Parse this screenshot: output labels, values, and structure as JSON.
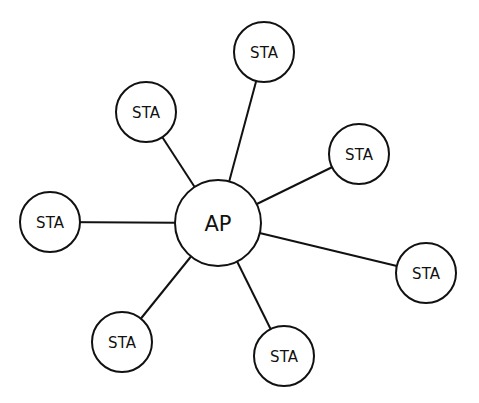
{
  "diagram": {
    "type": "star-topology",
    "colors": {
      "stroke": "#111111",
      "fill": "#ffffff",
      "background": "#ffffff"
    },
    "hub": {
      "id": "ap",
      "label": "AP",
      "x": 218,
      "y": 223,
      "r": 43
    },
    "nodes": [
      {
        "id": "sta-top",
        "label": "STA",
        "x": 264,
        "y": 52,
        "r": 30
      },
      {
        "id": "sta-upper-left",
        "label": "STA",
        "x": 146,
        "y": 112,
        "r": 30
      },
      {
        "id": "sta-upper-right",
        "label": "STA",
        "x": 359,
        "y": 154,
        "r": 30
      },
      {
        "id": "sta-left",
        "label": "STA",
        "x": 50,
        "y": 222,
        "r": 30
      },
      {
        "id": "sta-right",
        "label": "STA",
        "x": 426,
        "y": 273,
        "r": 30
      },
      {
        "id": "sta-lower-left",
        "label": "STA",
        "x": 122,
        "y": 342,
        "r": 30
      },
      {
        "id": "sta-lower-right",
        "label": "STA",
        "x": 284,
        "y": 356,
        "r": 30
      }
    ]
  }
}
